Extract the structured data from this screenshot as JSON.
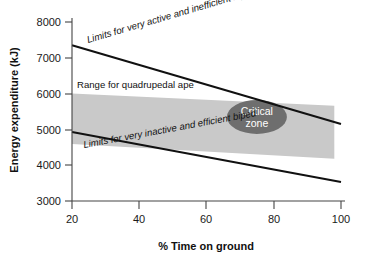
{
  "chart_data": {
    "type": "area",
    "title": "",
    "subtitle": "",
    "xlabel": "% Time on ground",
    "ylabel": "Energy expenditure (kJ)",
    "xlim": [
      20,
      100
    ],
    "ylim": [
      3000,
      8000
    ],
    "x_ticks": [
      20,
      40,
      60,
      80,
      100
    ],
    "x_tick_labels": [
      "20",
      "40",
      "60",
      "80",
      "100"
    ],
    "y_ticks": [
      3000,
      4000,
      5000,
      6000,
      7000,
      8000
    ],
    "y_tick_labels": [
      "3000",
      "4000",
      "5000",
      "6000",
      "7000",
      "8000"
    ],
    "grid": false,
    "legend_position": "none",
    "series": [
      {
        "name": "Limits for very active and inefficient biped",
        "type": "line",
        "x": [
          20,
          100
        ],
        "values": [
          7350,
          5150
        ],
        "color": "#111111"
      },
      {
        "name": "Limits for very inactive and efficient biped",
        "type": "line",
        "x": [
          20,
          100
        ],
        "values": [
          4930,
          3530
        ],
        "color": "#111111"
      },
      {
        "name": "Range for quadrupedal ape",
        "type": "area",
        "x": [
          20,
          98
        ],
        "upper": [
          6000,
          5660
        ],
        "lower": [
          4590,
          4180
        ],
        "color": "#c9c9c9"
      }
    ],
    "annotations": [
      {
        "name": "upper-limit-label",
        "text": "Limits for very active and inefficient biped",
        "style": "italic",
        "x": 34,
        "y": 7050,
        "rotation": -14.5
      },
      {
        "name": "band-label",
        "text": "Range for quadrupedal ape",
        "style": "plain",
        "x": 23,
        "y": 6150,
        "rotation": 0
      },
      {
        "name": "lower-limit-label",
        "text": "Limits for very inactive and efficient biped",
        "style": "italic",
        "x": 25,
        "y": 4500,
        "rotation": -11.5
      },
      {
        "name": "critical-zone-label",
        "text_line1": "Critical",
        "text_line2": "zone",
        "style": "ellipse",
        "x": 75,
        "y": 5350,
        "fill": "#6e6e6e",
        "text_color": "#ffffff"
      }
    ],
    "colors": {
      "band_fill": "#c9c9c9",
      "line": "#111111",
      "axis": "#444444",
      "ellipse_fill": "#6e6e6e",
      "ellipse_text": "#ffffff",
      "background": "#ffffff"
    }
  }
}
